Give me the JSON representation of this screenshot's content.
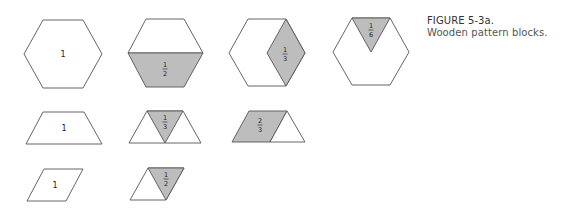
{
  "figure": {
    "caption_title": "FIGURE 5-3a.",
    "caption_text": "Wooden pattern blocks.",
    "colors": {
      "outline": "#555555",
      "shaded_fill": "#bdbdbd",
      "background": "#ffffff"
    }
  },
  "rows": [
    {
      "shape": "hexagon",
      "blocks": [
        {
          "label": "1",
          "shaded_part": "none"
        },
        {
          "label_num": "1",
          "label_den": "2",
          "shaded_part": "bottom trapezoid (half)"
        },
        {
          "label_num": "1",
          "label_den": "3",
          "shaded_part": "right rhombus (third)"
        },
        {
          "label_num": "1",
          "label_den": "6",
          "shaded_part": "top triangle (sixth)"
        }
      ]
    },
    {
      "shape": "trapezoid",
      "blocks": [
        {
          "label": "1",
          "shaded_part": "none"
        },
        {
          "label_num": "1",
          "label_den": "3",
          "shaded_part": "middle triangle (third)"
        },
        {
          "label_num": "2",
          "label_den": "3",
          "shaded_part": "left rhombus (two thirds)"
        }
      ]
    },
    {
      "shape": "rhombus",
      "blocks": [
        {
          "label": "1",
          "shaded_part": "none"
        },
        {
          "label_num": "1",
          "label_den": "2",
          "shaded_part": "right triangle (half)"
        }
      ]
    }
  ]
}
